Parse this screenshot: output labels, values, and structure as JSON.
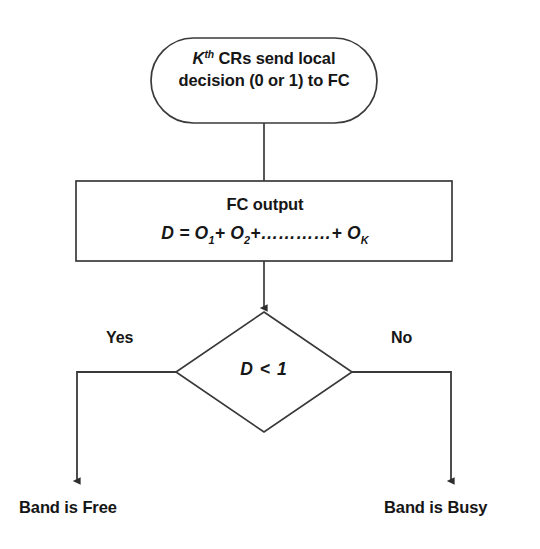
{
  "diagram": {
    "colors": {
      "stroke": "#3a3a3a",
      "text": "#161616",
      "background": "#ffffff"
    },
    "nodes": {
      "start": {
        "shape": "stadium",
        "line1_prefix": "K",
        "line1_superscript": "th",
        "line1_rest": " CRs send local",
        "line2": "decision (0 or 1) to FC"
      },
      "process": {
        "shape": "rectangle",
        "title": "FC output",
        "formula_lhs": "D = O",
        "formula_sub1": "1",
        "formula_mid1": "+ O",
        "formula_sub2": "2",
        "formula_mid2": "+",
        "formula_ellipsis": "…………",
        "formula_mid3": "+ O",
        "formula_sub3": "K"
      },
      "decision": {
        "shape": "diamond",
        "condition_lhs": "D",
        "condition_op": "<",
        "condition_rhs": "1"
      },
      "outcome_free": {
        "shape": "text",
        "label": "Band is Free"
      },
      "outcome_busy": {
        "shape": "text",
        "label": "Band is Busy"
      }
    },
    "edges": {
      "yes_label": "Yes",
      "no_label": "No"
    }
  }
}
